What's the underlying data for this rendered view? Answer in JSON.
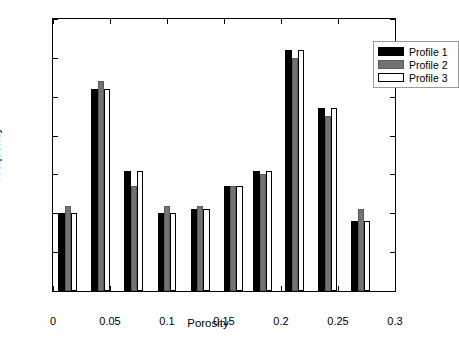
{
  "chart_data": {
    "type": "bar",
    "title": "",
    "subtitle": "",
    "xlabel": "Porosity",
    "ylabel": "Frequency",
    "xlim": [
      0,
      0.3
    ],
    "ylim": [
      0,
      70
    ],
    "xticks": [
      "0",
      "0.05",
      "0.1",
      "0.15",
      "0.2",
      "0.25",
      "0.3"
    ],
    "xtick_values": [
      0,
      0.05,
      0.1,
      0.15,
      0.2,
      0.25,
      0.3
    ],
    "yticks": [
      "0",
      "10",
      "20",
      "30",
      "40",
      "50",
      "60",
      "70"
    ],
    "ytick_values": [
      0,
      10,
      20,
      30,
      40,
      50,
      60,
      70
    ],
    "grid": false,
    "legend_position": "top-right",
    "bar_group_centers": [
      0.013,
      0.042,
      0.071,
      0.1,
      0.129,
      0.158,
      0.184,
      0.212,
      0.241,
      0.27
    ],
    "categories": [
      "0.013",
      "0.042",
      "0.071",
      "0.100",
      "0.129",
      "0.158",
      "0.184",
      "0.212",
      "0.241",
      "0.270"
    ],
    "series": [
      {
        "name": "Profile 1",
        "color": "#000000",
        "values": [
          20,
          52,
          31,
          20,
          21,
          27,
          31,
          62,
          47,
          18
        ]
      },
      {
        "name": "Profile 2",
        "color": "#737373",
        "values": [
          22,
          54,
          27,
          22,
          22,
          27,
          30,
          60,
          45,
          21
        ]
      },
      {
        "name": "Profile 3",
        "color": "#ffffff",
        "values": [
          20,
          52,
          31,
          20,
          21,
          27,
          31,
          62,
          47,
          18
        ]
      }
    ]
  },
  "legend": {
    "entries": [
      {
        "label": "Profile 1"
      },
      {
        "label": "Profile 2"
      },
      {
        "label": "Profile 3"
      }
    ]
  }
}
